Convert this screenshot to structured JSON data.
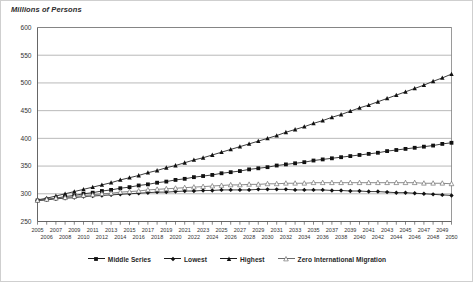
{
  "figure": {
    "axis_title": "Millions of Persons"
  },
  "legend": {
    "items": [
      {
        "label": "Middle Series",
        "marker": "filled-square-icon",
        "color": "#111111"
      },
      {
        "label": "Lowest",
        "marker": "filled-diamond-icon",
        "color": "#111111"
      },
      {
        "label": "Highest",
        "marker": "filled-triangle-icon",
        "color": "#111111"
      },
      {
        "label": "Zero International Migration",
        "marker": "open-triangle-icon",
        "color": "#6b6b6b"
      }
    ]
  },
  "chart_data": {
    "type": "line",
    "title": "",
    "subtitle": "",
    "xlabel": "",
    "ylabel": "Millions of Persons",
    "ylim": [
      250,
      600
    ],
    "ytick_step": 50,
    "yticks": [
      250,
      300,
      350,
      400,
      450,
      500,
      550,
      600
    ],
    "xlim": [
      2005,
      2050
    ],
    "grid": true,
    "grid_axis": "y",
    "legend_position": "bottom-center",
    "x": [
      2005,
      2006,
      2007,
      2008,
      2009,
      2010,
      2011,
      2012,
      2013,
      2014,
      2015,
      2016,
      2017,
      2018,
      2019,
      2020,
      2021,
      2022,
      2023,
      2024,
      2025,
      2026,
      2027,
      2028,
      2029,
      2030,
      2031,
      2032,
      2033,
      2034,
      2035,
      2036,
      2037,
      2038,
      2039,
      2040,
      2041,
      2042,
      2043,
      2044,
      2045,
      2046,
      2047,
      2048,
      2049,
      2050
    ],
    "xtick_labels_top": [
      2005,
      2007,
      2009,
      2011,
      2013,
      2015,
      2017,
      2019,
      2021,
      2023,
      2025,
      2027,
      2029,
      2031,
      2033,
      2035,
      2037,
      2039,
      2041,
      2043,
      2045,
      2047,
      2049
    ],
    "xtick_labels_bottom": [
      2006,
      2008,
      2010,
      2012,
      2014,
      2016,
      2018,
      2020,
      2022,
      2024,
      2026,
      2028,
      2030,
      2032,
      2034,
      2036,
      2038,
      2040,
      2042,
      2044,
      2046,
      2048,
      2050
    ],
    "series": [
      {
        "name": "Middle Series",
        "marker": "filled-square",
        "values": [
          288,
          290,
          292,
          295,
          297,
          300,
          302,
          305,
          307,
          310,
          312,
          315,
          317,
          320,
          322,
          325,
          327,
          330,
          332,
          334,
          337,
          339,
          341,
          344,
          346,
          348,
          351,
          353,
          355,
          357,
          360,
          362,
          364,
          366,
          368,
          370,
          372,
          374,
          377,
          379,
          381,
          383,
          385,
          387,
          390,
          392
        ]
      },
      {
        "name": "Lowest",
        "marker": "filled-diamond",
        "values": [
          288,
          289,
          291,
          292,
          293,
          295,
          296,
          297,
          298,
          299,
          300,
          301,
          302,
          303,
          303,
          304,
          305,
          305,
          306,
          306,
          307,
          307,
          307,
          307,
          308,
          308,
          308,
          308,
          307,
          307,
          307,
          307,
          306,
          306,
          305,
          305,
          304,
          304,
          303,
          302,
          302,
          301,
          300,
          299,
          298,
          297
        ]
      },
      {
        "name": "Highest",
        "marker": "filled-triangle",
        "values": [
          289,
          292,
          296,
          300,
          304,
          308,
          312,
          316,
          320,
          325,
          329,
          333,
          338,
          342,
          347,
          351,
          356,
          361,
          365,
          370,
          375,
          380,
          385,
          390,
          395,
          400,
          405,
          411,
          416,
          421,
          427,
          432,
          438,
          443,
          449,
          455,
          460,
          466,
          472,
          478,
          484,
          490,
          496,
          503,
          509,
          516
        ]
      },
      {
        "name": "Zero International Migration",
        "marker": "open-triangle",
        "values": [
          288,
          290,
          292,
          293,
          295,
          297,
          298,
          300,
          301,
          303,
          304,
          305,
          307,
          308,
          309,
          310,
          311,
          312,
          313,
          314,
          315,
          316,
          316,
          317,
          317,
          318,
          318,
          319,
          319,
          319,
          320,
          320,
          320,
          320,
          320,
          320,
          320,
          320,
          320,
          320,
          320,
          320,
          319,
          319,
          319,
          318
        ]
      }
    ]
  }
}
